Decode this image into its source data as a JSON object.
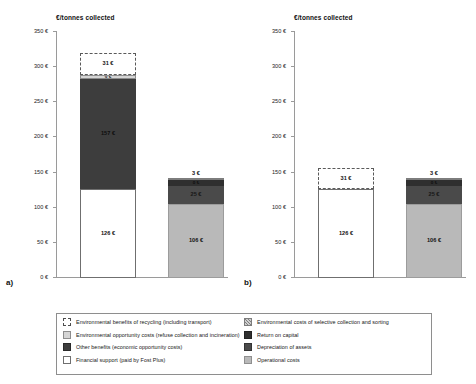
{
  "chart_data": {
    "type": "bar",
    "title": "",
    "subtitle": "",
    "ylabel": "€/tonnes collected",
    "xlabel": "",
    "ylim": [
      0,
      350
    ],
    "ytick_labels": [
      "350 €",
      "300 €",
      "250 €",
      "200 €",
      "150 €",
      "100 €",
      "50 €",
      "0 €"
    ],
    "ytick_values": [
      350,
      300,
      250,
      200,
      150,
      100,
      50,
      0
    ],
    "grid": false,
    "legend_position": "bottom",
    "panels": [
      {
        "tag": "a)",
        "ylabel": "€/tonnes collected",
        "bars": [
          {
            "name": "benefits-bar",
            "total": 320,
            "segments": [
              {
                "key": "support",
                "label": "Financial support (paid by Fost Plus)",
                "value": 126,
                "display": "126 €",
                "label_inside": true
              },
              {
                "key": "otherben",
                "label": "Other benefits (economic opportunity costs)",
                "value": 157,
                "display": "157 €",
                "label_inside": true
              },
              {
                "key": "envopp",
                "label": "Environmental opportunity costs (refuse collection and incineration)",
                "value": 6,
                "display": "6 €",
                "label_inside": true
              },
              {
                "key": "envben",
                "label": "Environmental benefits of recycling (including transport)",
                "value": 31,
                "display": "31 €",
                "label_inside": true
              }
            ]
          },
          {
            "name": "costs-bar",
            "total": 142,
            "segments": [
              {
                "key": "opcost",
                "label": "Operational costs",
                "value": 106,
                "display": "106 €",
                "label_inside": true
              },
              {
                "key": "deprec",
                "label": "Depreciation of assets",
                "value": 25,
                "display": "25 €",
                "label_inside": true
              },
              {
                "key": "retcap",
                "label": "Return on capital",
                "value": 8,
                "display": "8 €",
                "label_inside": true
              },
              {
                "key": "envcost",
                "label": "Environmental costs of selective collection and sorting",
                "value": 3,
                "display": "3 €",
                "label_inside": false
              }
            ]
          }
        ]
      },
      {
        "tag": "b)",
        "ylabel": "€/tonnes collected",
        "bars": [
          {
            "name": "benefits-bar",
            "total": 157,
            "segments": [
              {
                "key": "support",
                "label": "Financial support (paid by Fost Plus)",
                "value": 126,
                "display": "126 €",
                "label_inside": true
              },
              {
                "key": "envben",
                "label": "Environmental benefits of recycling (including transport)",
                "value": 31,
                "display": "31 €",
                "label_inside": true
              }
            ]
          },
          {
            "name": "costs-bar",
            "total": 142,
            "segments": [
              {
                "key": "opcost",
                "label": "Operational costs",
                "value": 106,
                "display": "106 €",
                "label_inside": true
              },
              {
                "key": "deprec",
                "label": "Depreciation of assets",
                "value": 25,
                "display": "25 €",
                "label_inside": true
              },
              {
                "key": "retcap",
                "label": "Return on capital",
                "value": 8,
                "display": "8 €",
                "label_inside": true
              },
              {
                "key": "envcost",
                "label": "Environmental costs of selective collection and sorting",
                "value": 3,
                "display": "3 €",
                "label_inside": false
              }
            ]
          }
        ]
      }
    ],
    "legend": {
      "left_column": [
        {
          "key": "envben",
          "label": "Environmental benefits of recycling (including transport)"
        },
        {
          "key": "envopp",
          "label": "Environmental opportunity costs (refuse collection and incineration)"
        },
        {
          "key": "otherben",
          "label": "Other benefits (economic opportunity costs)"
        },
        {
          "key": "support",
          "label": "Financial support (paid by Fost Plus)"
        }
      ],
      "right_column": [
        {
          "key": "envcost",
          "label": "Environmental costs of selective collection and sorting"
        },
        {
          "key": "retcap",
          "label": "Return on capital"
        },
        {
          "key": "deprec",
          "label": "Depreciation of assets"
        },
        {
          "key": "opcost",
          "label": "Operational costs"
        }
      ]
    },
    "colors": {
      "financial_support": "#ffffff",
      "other_benefits": "#3d3d3d",
      "environmental_opportunity_costs": "#d5d5d5",
      "environmental_benefits": "#ffffff",
      "operational_costs": "#b9b9b9",
      "depreciation_of_assets": "#4a4a4a",
      "return_on_capital": "#2f2f2f",
      "environmental_costs": "#cfcfcf",
      "axis": "#9a9a9a"
    }
  }
}
